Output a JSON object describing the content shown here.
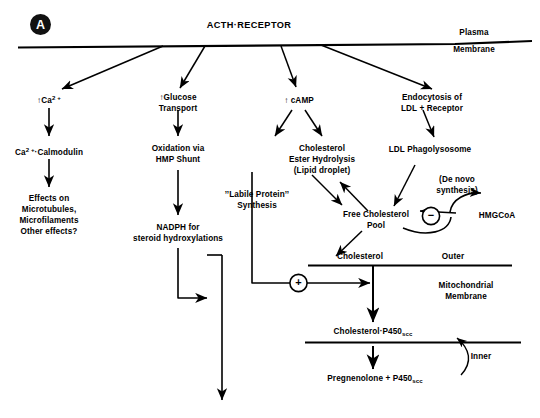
{
  "figure": {
    "panel_label": "A",
    "title": "ACTH·RECEPTOR"
  },
  "membranes": {
    "plasma_line1": "Plasma",
    "plasma_line2": "Membrane",
    "mito_line1": "Mitochondrial",
    "mito_line2": "Membrane",
    "outer": "Outer",
    "inner": "Inner"
  },
  "nodes": {
    "calcium": "↑Ca",
    "calcium_sup": "2 +",
    "calmodulin_pre": "Ca",
    "calmodulin_sup": "2 +",
    "calmodulin_post": "·Calmodulin",
    "effects_l1": "Effects on",
    "effects_l2": "Microtubules,",
    "effects_l3": "Microfilaments",
    "effects_l4": "Other effects?",
    "glucose_l1": "↑Glucose",
    "glucose_l2": "Transport",
    "oxidation_l1": "Oxidation via",
    "oxidation_l2": "HMP Shunt",
    "nadph_l1": "NADPH for",
    "nadph_l2": "steroid hydroxylations",
    "camp": "↑ cAMP",
    "chol_ester_l1": "Cholesterol",
    "chol_ester_l2": "Ester Hydrolysis",
    "chol_ester_l3": "(Lipid droplet)",
    "labile_l1": "’’Labile Protein’’",
    "labile_l2": "Synthesis",
    "endocytosis_l1": "Endocytosis of",
    "endocytosis_l2": "LDL  +  Receptor",
    "phagolysosome": "LDL Phagolysosome",
    "denovo_l1": "(De novo",
    "denovo_l2": "synthesis)",
    "hmgcoa": "HMGCoA",
    "free_chol_l1": "Free Cholesterol",
    "free_chol_l2": "Pool",
    "cholesterol": "Cholesterol",
    "chol_p450_pre": "Cholesterol·P450",
    "chol_p450_sub": "scc",
    "pregnenolone_pre": "Pregnenolone  +  P450",
    "pregnenolone_sub": "scc"
  },
  "signs": {
    "negative": "−",
    "positive": "+"
  },
  "colors": {
    "ink": "#000000",
    "background": "#ffffff"
  }
}
